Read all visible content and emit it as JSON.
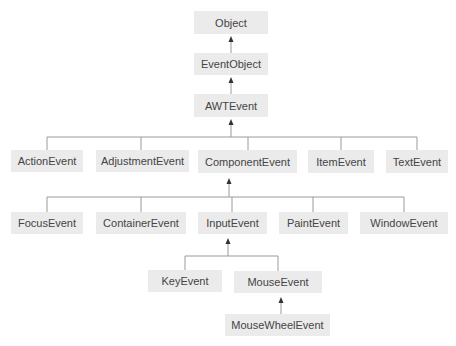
{
  "diagram": {
    "colors": {
      "node_fill": "#ebebeb",
      "text": "#444444",
      "line": "#9a9a9a",
      "arrow": "#333333"
    },
    "nodes": {
      "object": "Object",
      "event_object": "EventObject",
      "awt_event": "AWTEvent",
      "action_event": "ActionEvent",
      "adjustment_event": "AdjustmentEvent",
      "component_event": "ComponentEvent",
      "item_event": "ItemEvent",
      "text_event": "TextEvent",
      "focus_event": "FocusEvent",
      "container_event": "ContainerEvent",
      "input_event": "InputEvent",
      "paint_event": "PaintEvent",
      "window_event": "WindowEvent",
      "key_event": "KeyEvent",
      "mouse_event": "MouseEvent",
      "mouse_wheel_event": "MouseWheelEvent"
    },
    "edges": [
      [
        "EventObject",
        "Object"
      ],
      [
        "AWTEvent",
        "EventObject"
      ],
      [
        "ActionEvent",
        "AWTEvent"
      ],
      [
        "AdjustmentEvent",
        "AWTEvent"
      ],
      [
        "ComponentEvent",
        "AWTEvent"
      ],
      [
        "ItemEvent",
        "AWTEvent"
      ],
      [
        "TextEvent",
        "AWTEvent"
      ],
      [
        "FocusEvent",
        "ComponentEvent"
      ],
      [
        "ContainerEvent",
        "ComponentEvent"
      ],
      [
        "InputEvent",
        "ComponentEvent"
      ],
      [
        "PaintEvent",
        "ComponentEvent"
      ],
      [
        "WindowEvent",
        "ComponentEvent"
      ],
      [
        "KeyEvent",
        "InputEvent"
      ],
      [
        "MouseEvent",
        "InputEvent"
      ],
      [
        "MouseWheelEvent",
        "MouseEvent"
      ]
    ]
  }
}
